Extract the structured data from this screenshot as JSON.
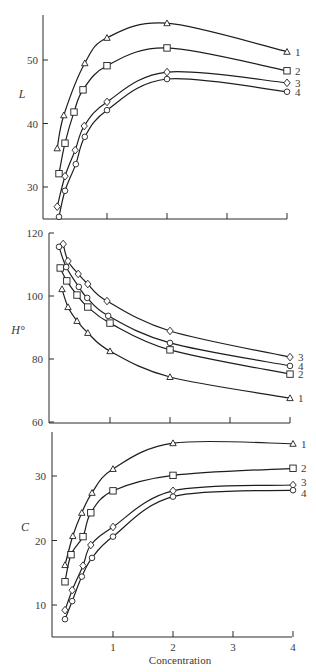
{
  "chart_data": [
    {
      "type": "line",
      "panel": "top",
      "title": "",
      "xlabel": "",
      "ylabel": "L",
      "ylim": [
        25,
        57
      ],
      "xlim": [
        0,
        4
      ],
      "yticks": [
        30,
        40,
        50
      ],
      "xticks": [
        1,
        2,
        3,
        4
      ],
      "show_xtick_labels": false,
      "grid": false,
      "x": [
        0.2,
        0.3,
        0.5,
        0.65,
        1,
        2,
        4
      ],
      "series": [
        {
          "name": "1",
          "marker": "triangle",
          "x": [
            0.17,
            0.28,
            0.63,
            1,
            2,
            4
          ],
          "values": [
            36.1,
            41.3,
            49.5,
            53.5,
            55.8,
            51.3
          ]
        },
        {
          "name": "2",
          "marker": "square",
          "x": [
            0.2,
            0.3,
            0.45,
            0.6,
            1,
            2,
            4
          ],
          "values": [
            32.1,
            36.9,
            41.8,
            45.3,
            49.1,
            51.9,
            48.3
          ]
        },
        {
          "name": "3",
          "marker": "diamond",
          "x": [
            0.17,
            0.3,
            0.47,
            0.62,
            1,
            2,
            4
          ],
          "values": [
            26.9,
            31.7,
            35.8,
            39.6,
            43.4,
            48.1,
            46.4
          ]
        },
        {
          "name": "4",
          "marker": "circle",
          "x": [
            0.2,
            0.3,
            0.48,
            0.63,
            1,
            2,
            4
          ],
          "values": [
            25.3,
            29.4,
            33.6,
            37.9,
            42.1,
            47.0,
            45.0
          ]
        }
      ]
    },
    {
      "type": "line",
      "panel": "middle",
      "title": "",
      "xlabel": "",
      "ylabel": "H°",
      "ylim": [
        60,
        120
      ],
      "xlim": [
        0,
        4
      ],
      "yticks": [
        60,
        80,
        100,
        120
      ],
      "xticks": [
        1,
        2,
        3,
        4
      ],
      "show_xtick_labels": false,
      "grid": false,
      "series": [
        {
          "name": "1",
          "marker": "triangle",
          "x": [
            0.2,
            0.3,
            0.45,
            0.63,
            1,
            2,
            4
          ],
          "values": [
            102.2,
            96.5,
            92.1,
            88.3,
            82.5,
            74.3,
            67.6
          ]
        },
        {
          "name": "2",
          "marker": "square",
          "x": [
            0.17,
            0.28,
            0.45,
            0.63,
            1,
            2,
            4
          ],
          "values": [
            108.9,
            104.8,
            100.3,
            96.5,
            91.4,
            82.9,
            75.2
          ]
        },
        {
          "name": "3",
          "marker": "diamond",
          "x": [
            0.22,
            0.3,
            0.47,
            0.63,
            0.95,
            2,
            4
          ],
          "values": [
            116.5,
            111.1,
            107.0,
            103.8,
            98.4,
            88.9,
            80.6
          ]
        },
        {
          "name": "4",
          "marker": "circle",
          "x": [
            0.15,
            0.27,
            0.48,
            0.62,
            0.97,
            2,
            4
          ],
          "values": [
            115.6,
            109.2,
            102.9,
            99.4,
            93.7,
            85.1,
            77.8
          ]
        }
      ]
    },
    {
      "type": "line",
      "panel": "bottom",
      "title": "",
      "xlabel": "Concentration",
      "ylabel": "C",
      "ylim": [
        5,
        37
      ],
      "xlim": [
        0,
        4
      ],
      "yticks": [
        10,
        20,
        30
      ],
      "xticks": [
        1,
        2,
        3,
        4
      ],
      "show_xtick_labels": true,
      "grid": false,
      "series": [
        {
          "name": "1",
          "marker": "triangle",
          "x": [
            0.2,
            0.33,
            0.48,
            0.65,
            1,
            2,
            4
          ],
          "values": [
            16.2,
            20.7,
            24.3,
            27.4,
            31.1,
            35.1,
            35.0
          ]
        },
        {
          "name": "2",
          "marker": "square",
          "x": [
            0.2,
            0.3,
            0.5,
            0.63,
            1,
            2,
            4
          ],
          "values": [
            13.6,
            17.8,
            20.6,
            24.3,
            27.7,
            30.1,
            31.2
          ]
        },
        {
          "name": "3",
          "marker": "diamond",
          "x": [
            0.2,
            0.32,
            0.5,
            0.63,
            1,
            2,
            4
          ],
          "values": [
            9.2,
            12.3,
            16.1,
            19.3,
            22.1,
            27.7,
            28.6
          ]
        },
        {
          "name": "4",
          "marker": "circle",
          "x": [
            0.2,
            0.32,
            0.48,
            0.65,
            1,
            2,
            4
          ],
          "values": [
            7.8,
            10.6,
            14.4,
            17.3,
            20.6,
            26.8,
            27.8
          ]
        }
      ]
    }
  ]
}
